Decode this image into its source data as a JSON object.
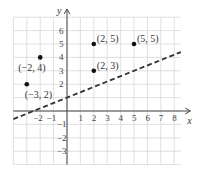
{
  "chart_data": {
    "type": "scatter",
    "title": "",
    "xlabel": "x",
    "ylabel": "y",
    "xlim": [
      -4,
      9
    ],
    "ylim": [
      -4,
      7
    ],
    "grid": true,
    "x_ticks": [
      "-2",
      "-1",
      "1",
      "2",
      "3",
      "4",
      "5",
      "6",
      "7",
      "8"
    ],
    "y_ticks": [
      "6",
      "5",
      "4",
      "3",
      "2",
      "-1",
      "-2",
      "-3"
    ],
    "points": [
      {
        "x": -3,
        "y": 2,
        "label": "(−3, 2)"
      },
      {
        "x": -2,
        "y": 4,
        "label": "(−2, 4)"
      },
      {
        "x": 2,
        "y": 5,
        "label": "(2, 5)"
      },
      {
        "x": 2,
        "y": 3,
        "label": "(2, 3)"
      },
      {
        "x": 5,
        "y": 5,
        "label": "(5, 5)"
      }
    ],
    "line": {
      "style": "dashed",
      "equation": "y = 0.4x + 1",
      "from": [
        -4,
        -0.6
      ],
      "to": [
        8.5,
        4.4
      ]
    }
  }
}
